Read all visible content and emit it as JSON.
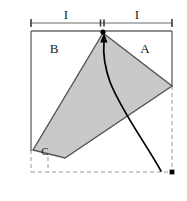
{
  "figure": {
    "type": "geometry-diagram",
    "background_color": "#ffffff",
    "outline_color": "#4d4d4d",
    "shape_fill_color": "#c9c9c9",
    "shape_stroke_color": "#555555",
    "arrow_color": "#000000",
    "dashed_color": "#999999",
    "labels": {
      "dim_left": "I",
      "dim_right": "I",
      "region_right": "A",
      "region_left": "B",
      "vertex_bottom_left": "C"
    },
    "dimension_line": {
      "tick_left_x": 31,
      "tick_mid_x": 102,
      "tick_right_x": 172,
      "y": 23
    },
    "outer_square": {
      "x": 31,
      "y": 31,
      "width": 141,
      "height": 141,
      "solid_edges": [
        "top",
        "left",
        "right-upper"
      ],
      "dashed_edges": [
        "bottom",
        "left-lower",
        "right-lower"
      ]
    },
    "rotated_square": {
      "vertices": [
        [
          103,
          33
        ],
        [
          172,
          86
        ],
        [
          65,
          158
        ],
        [
          33,
          150
        ]
      ]
    },
    "arrow": {
      "tail": [
        161,
        171
      ],
      "head": [
        104,
        39
      ],
      "head_dot": true
    },
    "points": [
      [
        103,
        32
      ],
      [
        172,
        172
      ]
    ]
  }
}
